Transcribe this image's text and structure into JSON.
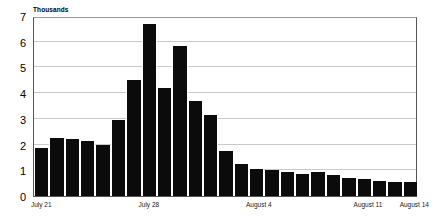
{
  "chart_data": {
    "type": "bar",
    "title": "",
    "subtitle": "",
    "axis_title": "Thousands",
    "xlabel": "",
    "ylabel": "Thousands",
    "ylim": [
      0,
      7
    ],
    "ytick_values": [
      0,
      1,
      2,
      3,
      4,
      5,
      6,
      7
    ],
    "ytick_labels": [
      "0",
      "1",
      "2",
      "3",
      "4",
      "5",
      "6",
      "7"
    ],
    "grid": true,
    "legend": null,
    "bar_color": "#0b0b0b",
    "gridline_color": "#c9c9c9",
    "frame_color": "#555555",
    "categories": [
      "July 21",
      "July 22",
      "July 23",
      "July 24",
      "July 25",
      "July 26",
      "July 27",
      "July 28",
      "July 29",
      "July 30",
      "July 31",
      "August 1",
      "August 2",
      "August 3",
      "August 4",
      "August 5",
      "August 6",
      "August 7",
      "August 8",
      "August 9",
      "August 10",
      "August 11",
      "August 12",
      "August 13",
      "August 14"
    ],
    "values": [
      1.85,
      2.25,
      2.2,
      2.15,
      2.0,
      2.95,
      4.5,
      6.7,
      4.2,
      5.85,
      3.7,
      3.15,
      1.75,
      1.25,
      1.05,
      1.0,
      0.95,
      0.85,
      0.95,
      0.8,
      0.7,
      0.65,
      0.6,
      0.55,
      0.55
    ],
    "xtick_labels": [
      {
        "label": "July 21",
        "index": 0
      },
      {
        "label": "July 28",
        "index": 7
      },
      {
        "label": "August 4",
        "index": 14
      },
      {
        "label": "August 11",
        "index": 21
      },
      {
        "label": "August 14",
        "index": 24
      }
    ]
  }
}
